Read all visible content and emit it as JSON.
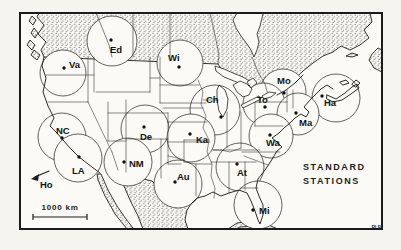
{
  "figure": {
    "kind": "standard-stations-map",
    "title_lines": [
      "STANDARD",
      "STATIONS"
    ],
    "credit": "RLB",
    "scale_bar": {
      "label": "1000 km",
      "length_km": 1000
    },
    "off_map_station": {
      "label": "Ho",
      "note": "arrow points off map to southwest"
    },
    "colors": {
      "ink": "#1f1f1f",
      "paper": "#f5f4ef",
      "map_background": "#fbfaf6"
    },
    "station_dot_radius": 1.7,
    "stations": [
      {
        "label": "Va",
        "dot": [
          64,
          68
        ],
        "label_pos": [
          69,
          68
        ],
        "circle": [
          63,
          73
        ],
        "r": 23
      },
      {
        "label": "Ed",
        "dot": [
          111,
          40
        ],
        "label_pos": [
          110,
          53
        ],
        "circle": [
          112,
          41
        ],
        "r": 25
      },
      {
        "label": "Wi",
        "dot": [
          179,
          67
        ],
        "label_pos": [
          168,
          61
        ],
        "circle": [
          180,
          63
        ],
        "r": 23
      },
      {
        "label": "Ch",
        "dot": [
          221,
          117
        ],
        "label_pos": [
          206,
          103
        ],
        "circle": [
          215,
          110
        ],
        "r": 25
      },
      {
        "label": "Mo",
        "dot": [
          284,
          93
        ],
        "label_pos": [
          277,
          84
        ],
        "circle": [
          283,
          92
        ],
        "r": 23
      },
      {
        "label": "To",
        "dot": [
          265,
          107
        ],
        "label_pos": [
          257,
          103
        ],
        "circle": [
          264,
          104
        ],
        "r": 21
      },
      {
        "label": "Ha",
        "dot": [
          322,
          96
        ],
        "label_pos": [
          324,
          106
        ],
        "circle": [
          336,
          98
        ],
        "r": 24
      },
      {
        "label": "Ma",
        "dot": [
          296,
          113
        ],
        "label_pos": [
          299,
          126
        ],
        "circle": [
          298,
          114
        ],
        "r": 21
      },
      {
        "label": "Wa",
        "dot": [
          270,
          135
        ],
        "label_pos": [
          266,
          146
        ],
        "circle": [
          271,
          136
        ],
        "r": 22
      },
      {
        "label": "NC",
        "dot": [
          62,
          138
        ],
        "label_pos": [
          56,
          134
        ],
        "circle": [
          62,
          137
        ],
        "r": 24
      },
      {
        "label": "De",
        "dot": [
          144,
          127
        ],
        "label_pos": [
          140,
          140
        ],
        "circle": [
          145,
          129
        ],
        "r": 24
      },
      {
        "label": "Ka",
        "dot": [
          190,
          134
        ],
        "label_pos": [
          196,
          143
        ],
        "circle": [
          191,
          138
        ],
        "r": 24
      },
      {
        "label": "NM",
        "dot": [
          124,
          162
        ],
        "label_pos": [
          129,
          167
        ],
        "circle": [
          128,
          162
        ],
        "r": 24
      },
      {
        "label": "LA",
        "dot": [
          79,
          157
        ],
        "label_pos": [
          72,
          174
        ],
        "circle": [
          78,
          158
        ],
        "r": 24
      },
      {
        "label": "Au",
        "dot": [
          175,
          182
        ],
        "label_pos": [
          177,
          180
        ],
        "circle": [
          178,
          184
        ],
        "r": 24
      },
      {
        "label": "At",
        "dot": [
          237,
          164
        ],
        "label_pos": [
          237,
          176
        ],
        "circle": [
          240,
          167
        ],
        "r": 24
      },
      {
        "label": "Mi",
        "dot": [
          253,
          210
        ],
        "label_pos": [
          259,
          214
        ],
        "circle": [
          258,
          205
        ],
        "r": 24
      }
    ]
  }
}
